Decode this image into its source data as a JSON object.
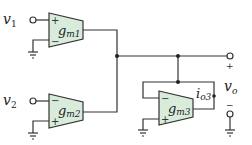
{
  "diagram": {
    "type": "circuit-schematic",
    "title": "",
    "colors": {
      "wire": "#333333",
      "amp_fill": "#d9ecdc",
      "background": "#ffffff"
    },
    "inputs": [
      {
        "symbol": "v",
        "sub": "1"
      },
      {
        "symbol": "v",
        "sub": "2"
      }
    ],
    "amplifiers": [
      {
        "symbol": "g",
        "sub": "m1",
        "top_sign": "+",
        "bottom_sign": "−"
      },
      {
        "symbol": "g",
        "sub": "m2",
        "top_sign": "−",
        "bottom_sign": "+"
      },
      {
        "symbol": "g",
        "sub": "m3",
        "top_sign": "−",
        "bottom_sign": "+"
      }
    ],
    "current_label": {
      "symbol": "i",
      "sub": "o3"
    },
    "output": {
      "symbol": "v",
      "sub": "o",
      "plus": "+",
      "minus": "−"
    }
  }
}
